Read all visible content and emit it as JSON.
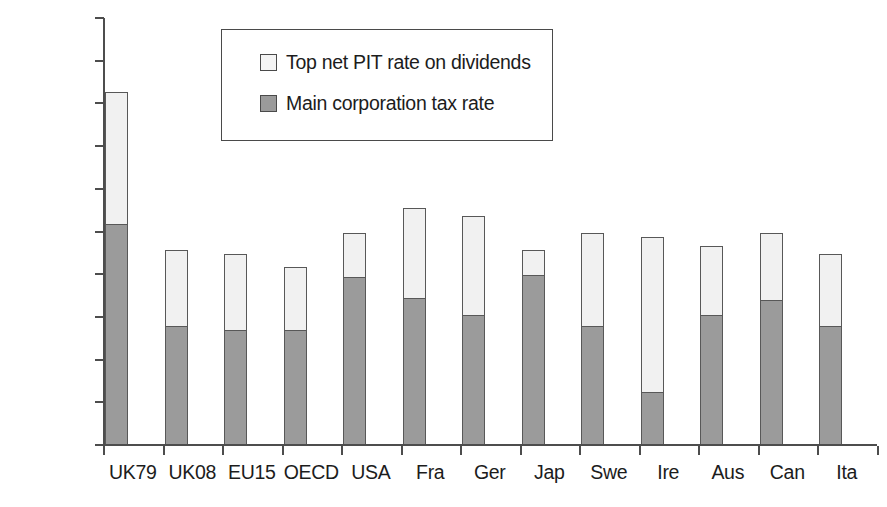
{
  "chart_data": {
    "type": "bar",
    "subtype": "stacked",
    "title": "",
    "xlabel": "",
    "ylabel": "",
    "ylim": [
      0,
      100
    ],
    "ytick_labels": [
      "100%",
      "90%",
      "80%",
      "70%",
      "60%",
      "50%",
      "40%",
      "30%",
      "20%",
      "10%",
      "0%"
    ],
    "ytick_values": [
      100,
      90,
      80,
      70,
      60,
      50,
      40,
      30,
      20,
      10,
      0
    ],
    "grid": false,
    "legend_position": "inside-top-center",
    "categories": [
      "UK79",
      "UK08",
      "EU15",
      "OECD",
      "USA",
      "Fra",
      "Ger",
      "Jap",
      "Swe",
      "Ire",
      "Aus",
      "Can",
      "Ita"
    ],
    "series": [
      {
        "name": "Main corporation tax rate",
        "color": "#9b9b9b",
        "values": [
          52,
          28,
          27,
          27,
          39.5,
          34.5,
          30.5,
          40,
          28,
          12.5,
          30.5,
          34,
          28
        ]
      },
      {
        "name": "Top net PIT rate on dividends",
        "color": "#f1f1f1",
        "values": [
          31,
          18,
          18,
          15,
          10.5,
          21.5,
          23.5,
          6,
          22,
          36.5,
          16.5,
          16,
          17
        ]
      }
    ],
    "totals": [
      83,
      46,
      45,
      42,
      50,
      56,
      54,
      46,
      50,
      49,
      47,
      50,
      45
    ]
  },
  "legend": {
    "entries": [
      {
        "label": "Top net PIT rate on dividends",
        "swatch": "light"
      },
      {
        "label": "Main corporation tax rate",
        "swatch": "dark"
      }
    ]
  }
}
